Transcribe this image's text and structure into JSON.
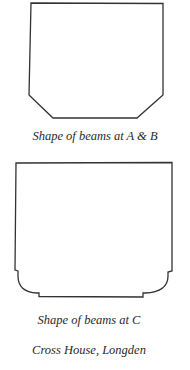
{
  "figures": [
    {
      "id": "beam-ab",
      "caption": "Shape of beams at A & B",
      "shape": "chamfered-rectangle"
    },
    {
      "id": "beam-c",
      "caption": "Shape of beams at C",
      "shape": "rectangle-with-cove-moulded-lower-arrises"
    }
  ],
  "location_caption": "Cross House, Longden",
  "colors": {
    "line": "#333333",
    "text": "#2a2a2a",
    "background": "#ffffff"
  }
}
